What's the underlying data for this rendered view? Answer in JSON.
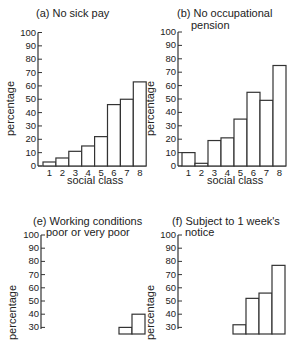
{
  "chart_data": [
    {
      "type": "bar",
      "panel": "a",
      "title": "(a) No sick pay",
      "xlabel": "social class",
      "ylabel": "percentage",
      "categories": [
        "1",
        "2",
        "3",
        "4",
        "5",
        "6",
        "7",
        "8"
      ],
      "values": [
        3,
        6,
        11,
        15,
        22,
        46,
        50,
        63
      ],
      "ylim": [
        0,
        100
      ],
      "yticks": [
        0,
        10,
        20,
        30,
        40,
        50,
        60,
        70,
        80,
        90,
        100
      ],
      "grid": false
    },
    {
      "type": "bar",
      "panel": "b",
      "title": "(b) No occupational pension",
      "xlabel": "social class",
      "ylabel": "percentage",
      "categories": [
        "1",
        "2",
        "3",
        "4",
        "5",
        "6",
        "7",
        "8"
      ],
      "values": [
        10,
        2,
        19,
        21,
        35,
        55,
        49,
        75
      ],
      "ylim": [
        0,
        100
      ],
      "yticks": [
        0,
        10,
        20,
        30,
        40,
        50,
        60,
        70,
        80,
        90,
        100
      ],
      "grid": false
    },
    {
      "type": "bar",
      "panel": "e",
      "title": "(e) Working conditions poor or very poor",
      "xlabel": "",
      "ylabel": "percentage",
      "categories": [
        "1",
        "2",
        "3",
        "4",
        "5",
        "6",
        "7",
        "8"
      ],
      "values": [
        null,
        null,
        null,
        null,
        null,
        null,
        30,
        40
      ],
      "ylim": [
        0,
        100
      ],
      "yticks": [
        30,
        40,
        50,
        60,
        70,
        80,
        90,
        100
      ],
      "grid": false,
      "note": "panel cropped at bottom; only bars above ~30% visible"
    },
    {
      "type": "bar",
      "panel": "f",
      "title": "(f) Subject to 1 week's notice",
      "xlabel": "",
      "ylabel": "percentage",
      "categories": [
        "1",
        "2",
        "3",
        "4",
        "5",
        "6",
        "7",
        "8"
      ],
      "values": [
        null,
        null,
        null,
        null,
        32,
        52,
        56,
        77
      ],
      "ylim": [
        0,
        100
      ],
      "yticks": [
        30,
        40,
        50,
        60,
        70,
        80,
        90,
        100
      ],
      "grid": false,
      "note": "panel cropped at bottom; only bars above ~30% visible"
    }
  ],
  "panels": {
    "a": {
      "title_line1": "(a) No sick pay",
      "title_line2": "",
      "ylabel": "percentage",
      "xlabel": "social class"
    },
    "b": {
      "title_line1": "(b) No occupational",
      "title_line2": "pension",
      "ylabel": "percentage",
      "xlabel": "social class"
    },
    "e": {
      "title_line1": "(e) Working conditions",
      "title_line2": "poor or very poor",
      "ylabel": "percentage",
      "xlabel": ""
    },
    "f": {
      "title_line1": "(f) Subject to 1 week's",
      "title_line2": "notice",
      "ylabel": "percentage",
      "xlabel": ""
    }
  },
  "colors": {
    "bar_fill": "#ffffff",
    "bar_stroke": "#333333",
    "axis": "#333333",
    "text": "#222222"
  }
}
